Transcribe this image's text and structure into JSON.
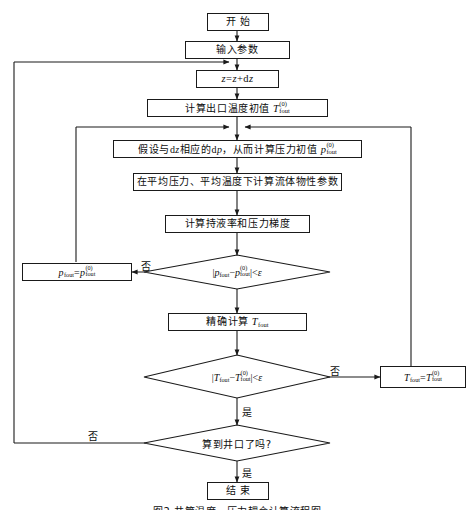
{
  "figure": {
    "caption": "图2   井筒温度、压力耦合计算流程图",
    "background_color": "#ffffff",
    "line_color": "#1a1a1a",
    "text_color": "#0d0d0d"
  },
  "nodes": {
    "start": {
      "label": "开  始",
      "type": "terminator"
    },
    "input_params": {
      "label": "输入参数",
      "type": "process"
    },
    "step_z": {
      "label_plain": "z=z+dz",
      "type": "process"
    },
    "init_temp": {
      "label_plain": "计算出口温度初值 T(0)fout",
      "type": "process"
    },
    "assume_dp": {
      "label_plain": "假设与dz相应的dp，从而计算压力初值 p(0)fout",
      "type": "process"
    },
    "fluid_props": {
      "label": "在平均压力、平均温度下计算流体物性参数",
      "type": "process"
    },
    "holdup_grad": {
      "label": "计算持液率和压力梯度",
      "type": "process"
    },
    "p_check": {
      "label_plain": "|pfout−p(0)fout|<ε",
      "type": "decision"
    },
    "p_update": {
      "label_plain": "pfout=p(0)fout",
      "type": "process"
    },
    "exact_temp": {
      "label_plain": "精确计算 Tfout",
      "type": "process"
    },
    "t_check": {
      "label_plain": "|Tfout−T(0)fout|<ε",
      "type": "decision"
    },
    "t_update": {
      "label_plain": "Tfout=T(0)fout",
      "type": "process"
    },
    "wellhead_check": {
      "label": "算到井口了吗?",
      "type": "decision"
    },
    "end": {
      "label": "结  束",
      "type": "terminator"
    }
  },
  "edge_labels": {
    "p_no": "否",
    "t_no": "否",
    "t_yes": "是",
    "wellhead_no": "否",
    "wellhead_yes": "是"
  }
}
